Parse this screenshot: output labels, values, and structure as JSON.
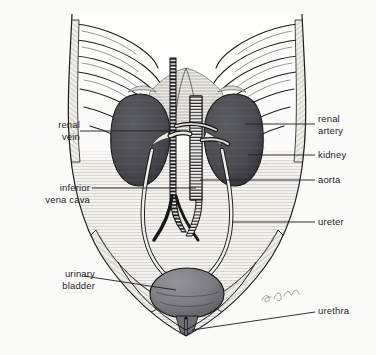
{
  "figure": {
    "signature": "a. Moore",
    "background_color": "#fbfbfa",
    "ink_color": "#1b1b1b"
  },
  "labels": {
    "left": [
      {
        "id": "renal-vein",
        "line1": "renal",
        "line2": "vein"
      },
      {
        "id": "inferior-vena-cava",
        "line1": "inferior",
        "line2": "vena cava"
      },
      {
        "id": "urinary-bladder",
        "line1": "urinary",
        "line2": "bladder"
      }
    ],
    "right": [
      {
        "id": "renal-artery",
        "line1": "renal",
        "line2": "artery"
      },
      {
        "id": "kidney",
        "line1": "kidney",
        "line2": ""
      },
      {
        "id": "aorta",
        "line1": "aorta",
        "line2": ""
      },
      {
        "id": "ureter",
        "line1": "ureter",
        "line2": ""
      },
      {
        "id": "urethra",
        "line1": "urethra",
        "line2": ""
      }
    ]
  },
  "structures": {
    "kidney_fill": "#4a4a50",
    "bladder_fill": "#7b7b80",
    "spine_fill": "#2a2a2c",
    "vessel_fill": "#e8e6e2",
    "tissue_fill": "#f2f0ec",
    "outline": "#1b1b1b"
  }
}
